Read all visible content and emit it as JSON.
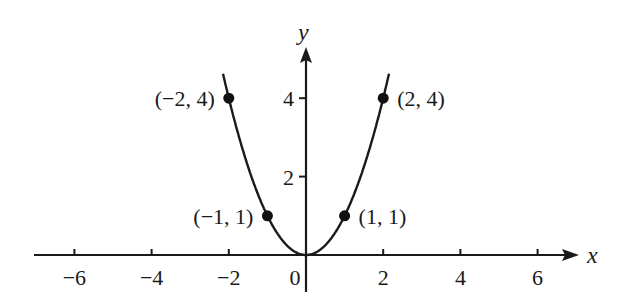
{
  "chart_data": {
    "type": "line",
    "title": "",
    "function": "y = x^2",
    "xlabel": "x",
    "ylabel": "y",
    "xlim": [
      -7,
      7
    ],
    "ylim": [
      0,
      5
    ],
    "x_ticks": [
      -6,
      -4,
      -2,
      0,
      2,
      4,
      6
    ],
    "x_tick_labels": [
      "−6",
      "−4",
      "−2",
      "0",
      "2",
      "4",
      "6"
    ],
    "y_ticks": [
      2,
      4
    ],
    "y_tick_labels": [
      "2",
      "4"
    ],
    "grid": false,
    "series": [
      {
        "name": "y = x^2",
        "x": [
          -2.15,
          -2,
          -1,
          0,
          1,
          2,
          2.15
        ],
        "y": [
          4.62,
          4,
          1,
          0,
          1,
          4,
          4.62
        ]
      }
    ],
    "points": [
      {
        "x": -2,
        "y": 4,
        "label": "(−2, 4)"
      },
      {
        "x": -1,
        "y": 1,
        "label": "(−1, 1)"
      },
      {
        "x": 1,
        "y": 1,
        "label": "(1, 1)"
      },
      {
        "x": 2,
        "y": 4,
        "label": "(2, 4)"
      }
    ]
  }
}
